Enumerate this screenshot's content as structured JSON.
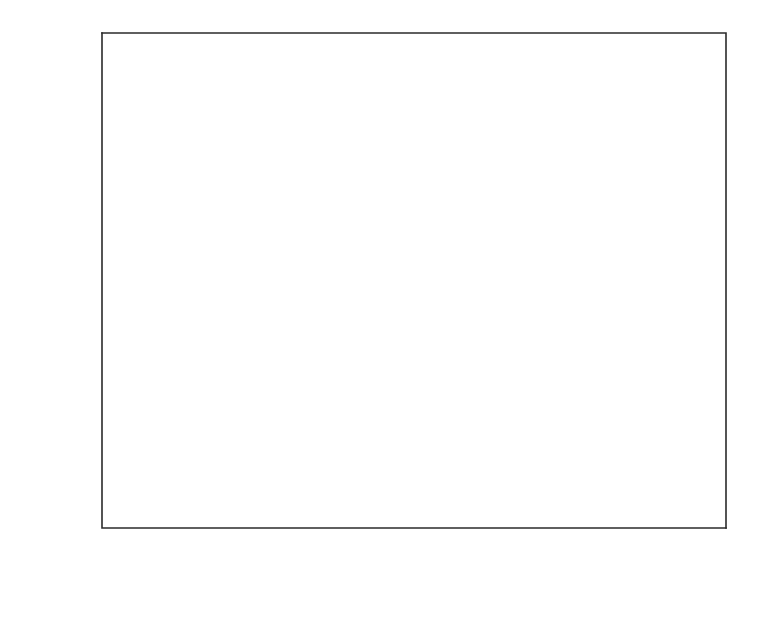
{
  "chart_data": {
    "type": "line",
    "title": "",
    "subtitle": "",
    "xlabel": "Mean arrival rate λ",
    "ylabel": "E[P] (P_S)",
    "ylabel_parts": {
      "main": "E[P] (P",
      "sub": "S",
      "tail": ")"
    },
    "xlim": [
      0.01,
      0.1
    ],
    "ylim": [
      1.0,
      3.5
    ],
    "grid": false,
    "legend_position": "inline-right",
    "x_major_ticks": [
      0.02,
      0.04,
      0.06,
      0.08,
      0.1
    ],
    "x_major_tick_labels": [
      "0.02",
      "0.04",
      "0.06",
      "0.08",
      "0.10"
    ],
    "x_minor_ticks": [
      0.01,
      0.03,
      0.05,
      0.07,
      0.09
    ],
    "y_major_ticks": [
      1.0,
      1.5,
      2.0,
      2.5,
      3.0,
      3.5
    ],
    "y_major_tick_labels": [
      "1.0",
      "1.5",
      "2.0",
      "2.5",
      "3.0",
      "3.5"
    ],
    "y_minor_ticks": [
      1.25,
      1.75,
      2.25,
      2.75,
      3.25
    ],
    "x": [
      0.01,
      0.015,
      0.02,
      0.025,
      0.03,
      0.035,
      0.04,
      0.045,
      0.05,
      0.055,
      0.06,
      0.065,
      0.07,
      0.075,
      0.08,
      0.085,
      0.09,
      0.095,
      0.1
    ],
    "series": [
      {
        "name": "T_min = 1",
        "label_main": "T",
        "label_sub": "min",
        "label_tail": " = 1",
        "values": [
          2.03,
          2.19,
          2.31,
          2.41,
          2.5,
          2.57,
          2.63,
          2.68,
          2.73,
          2.77,
          2.81,
          2.84,
          2.88,
          2.91,
          2.94,
          2.97,
          3.0,
          3.02,
          3.05
        ]
      },
      {
        "name": "T_min = 2",
        "label_main": "T",
        "label_sub": "min",
        "label_tail": " = 2",
        "values": [
          1.75,
          1.85,
          1.93,
          1.99,
          2.05,
          2.1,
          2.14,
          2.17,
          2.21,
          2.24,
          2.26,
          2.29,
          2.31,
          2.33,
          2.35,
          2.36,
          2.37,
          2.38,
          2.39
        ]
      },
      {
        "name": "T_min = 4",
        "label_main": "T",
        "label_sub": "min",
        "label_tail": " = 4",
        "values": [
          1.52,
          1.58,
          1.63,
          1.67,
          1.7,
          1.73,
          1.75,
          1.77,
          1.79,
          1.8,
          1.82,
          1.83,
          1.84,
          1.85,
          1.855,
          1.86,
          1.865,
          1.87,
          1.875
        ]
      },
      {
        "name": "T_min = 8",
        "label_main": "T",
        "label_sub": "min",
        "label_tail": " = 8",
        "values": [
          1.335,
          1.37,
          1.395,
          1.415,
          1.43,
          1.443,
          1.455,
          1.465,
          1.473,
          1.48,
          1.486,
          1.491,
          1.495,
          1.499,
          1.502,
          1.505,
          1.507,
          1.509,
          1.51
        ]
      },
      {
        "name": "T_min = 16",
        "label_main": "T",
        "label_sub": "min",
        "label_tail": " = 16",
        "values": [
          1.21,
          1.225,
          1.235,
          1.243,
          1.249,
          1.254,
          1.258,
          1.261,
          1.264,
          1.266,
          1.268,
          1.27,
          1.271,
          1.272,
          1.273,
          1.274,
          1.275,
          1.276,
          1.277
        ]
      },
      {
        "name": "T_min = 32",
        "label_main": "T",
        "label_sub": "min",
        "label_tail": " = 32",
        "values": [
          1.125,
          1.131,
          1.135,
          1.138,
          1.14,
          1.142,
          1.143,
          1.144,
          1.145,
          1.146,
          1.147,
          1.1475,
          1.148,
          1.1485,
          1.149,
          1.1495,
          1.15,
          1.1505,
          1.151
        ]
      }
    ],
    "series_label_anchors": [
      {
        "x": 0.0905,
        "y": 3.255
      },
      {
        "x": 0.0905,
        "y": 2.585
      },
      {
        "x": 0.09,
        "y": 1.985
      },
      {
        "x": 0.09,
        "y": 1.66
      },
      {
        "x": 0.09,
        "y": 1.39
      },
      {
        "x": 0.09,
        "y": 1.262
      }
    ],
    "colors": {
      "background": "#ffffff",
      "axis": "#2b2b2b",
      "curve": "#2e2e2e",
      "text": "#1a1a1a"
    }
  }
}
